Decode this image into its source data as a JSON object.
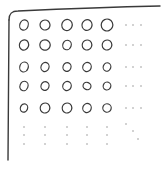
{
  "diagram": {
    "colors": {
      "ink": "#3a3a3a",
      "dots": "#9a9a9a",
      "background": "#ffffff"
    },
    "grid": {
      "rows": 5,
      "cols": 5,
      "col_x": [
        24,
        45,
        67,
        87,
        107
      ],
      "row_y": [
        25,
        45,
        67,
        86,
        108
      ],
      "element": "circle"
    },
    "ellipses": {
      "horizontal": "row-continuation",
      "vertical": "column-continuation",
      "diagonal": "diagonal-continuation"
    }
  }
}
